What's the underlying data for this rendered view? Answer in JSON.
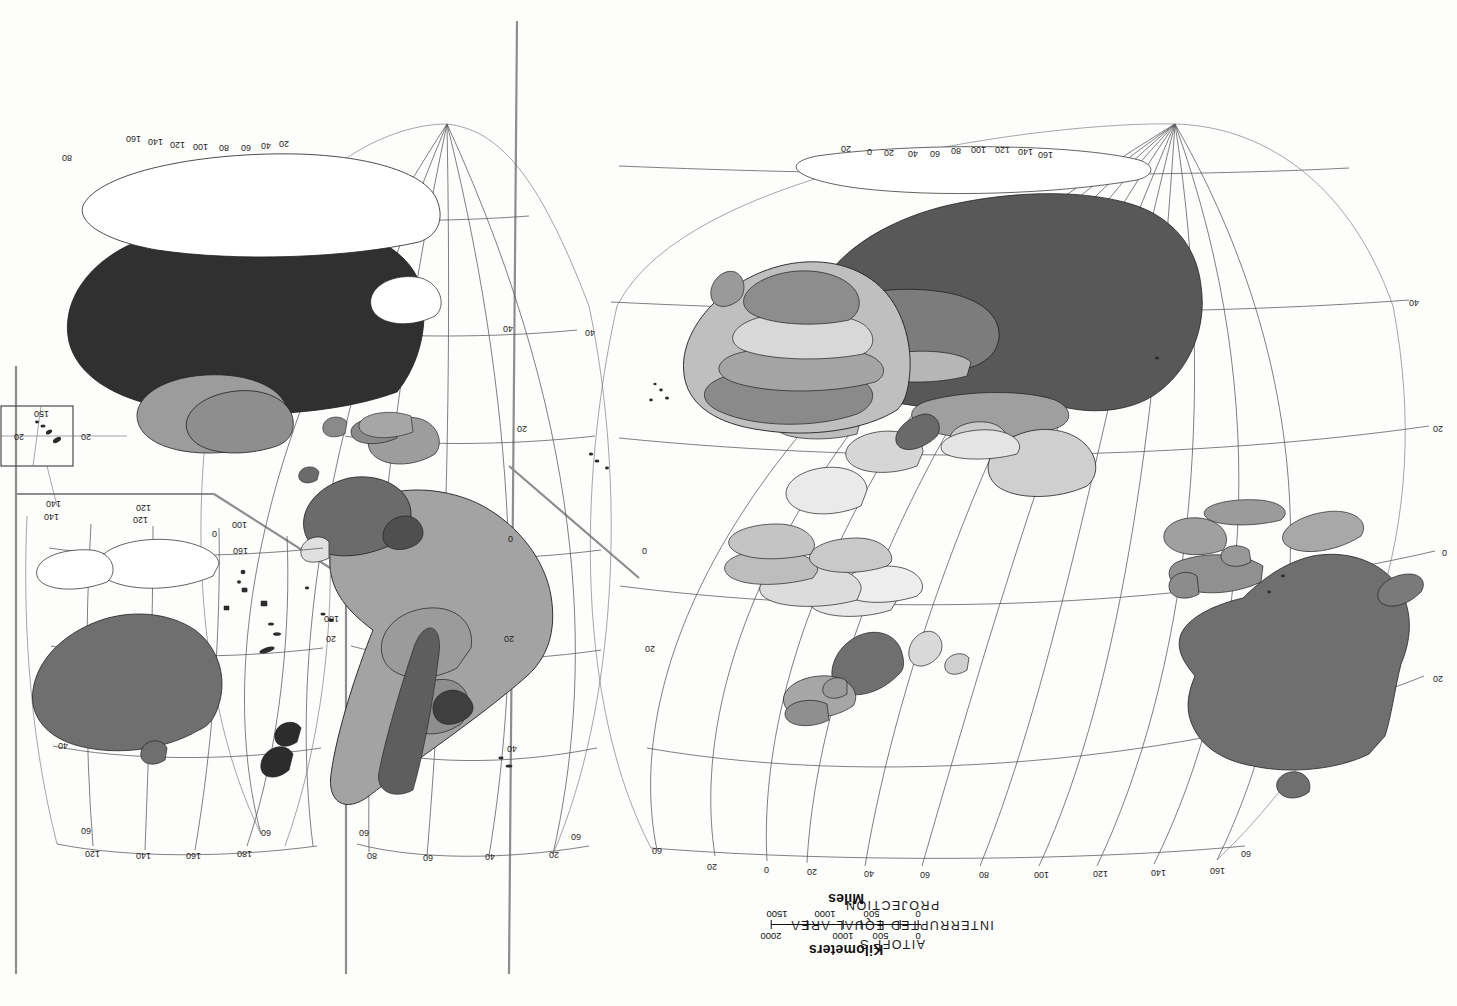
{
  "document": {
    "kind": "scanned-map-page",
    "orientation": "rotated-180",
    "page_background": "#fdfdfc"
  },
  "title": {
    "line1": "AITOFF'S",
    "line2": "INTERRUPTED EQUAL-AREA",
    "line3": "PROJECTION"
  },
  "scales": [
    {
      "name": "kilometers-scale",
      "label": "Kilometers",
      "ticks": [
        "0",
        "500",
        "1000",
        "2000"
      ],
      "tick_positions": [
        0,
        25,
        50,
        100
      ]
    },
    {
      "name": "miles-scale",
      "label": "Miles",
      "ticks": [
        "0",
        "500",
        "1000",
        "1500"
      ],
      "tick_positions": [
        0,
        31,
        62,
        93
      ]
    }
  ],
  "graticule": {
    "lobe_left": {
      "name": "eastern-hemisphere-lobe",
      "top_longitudes": [
        "160",
        "140",
        "120",
        "100",
        "80",
        "60",
        "40",
        "20",
        "0",
        "20"
      ],
      "top_latitude_left": "60",
      "top_latitude_right": "60",
      "left_latitudes": [
        "20",
        "0",
        "20",
        "40"
      ],
      "right_latitudes": [
        "20",
        "0",
        "40"
      ],
      "pole_longitudes": [
        "160",
        "140",
        "120",
        "100",
        "80",
        "60",
        "40",
        "20",
        "0",
        "20"
      ]
    },
    "lobe_middle": {
      "name": "americas-lobe",
      "top_longitudes": [
        "20",
        "40",
        "60",
        "80"
      ],
      "top_latitude_left": "60",
      "top_latitude_right": "60",
      "side_latitudes": [
        "40",
        "20",
        "0",
        "20",
        "40"
      ],
      "interior_labels": [
        "180",
        "20",
        "160",
        "100",
        "0"
      ],
      "pole_longitudes": [
        "20",
        "40",
        "60",
        "80",
        "100",
        "120",
        "140",
        "160",
        "80"
      ]
    },
    "lobe_right": {
      "name": "pacific-lobe",
      "top_longitudes": [
        "180",
        "160",
        "140",
        "120"
      ],
      "top_latitude_left": "60",
      "top_latitude_right": "60",
      "side_latitudes": [
        "40",
        "20",
        "0"
      ],
      "interior_labels": [
        "120",
        "140",
        "120",
        "140"
      ]
    },
    "inset": {
      "name": "island-inset",
      "labels": [
        "20",
        "20",
        "150"
      ]
    }
  },
  "legend_shades": {
    "very_dark": "#2e2e2e",
    "dark": "#4a4a4a",
    "medium": "#7b7b7b",
    "light": "#a8a8a8",
    "very_light": "#d2d2d2",
    "white": "#ffffff"
  }
}
